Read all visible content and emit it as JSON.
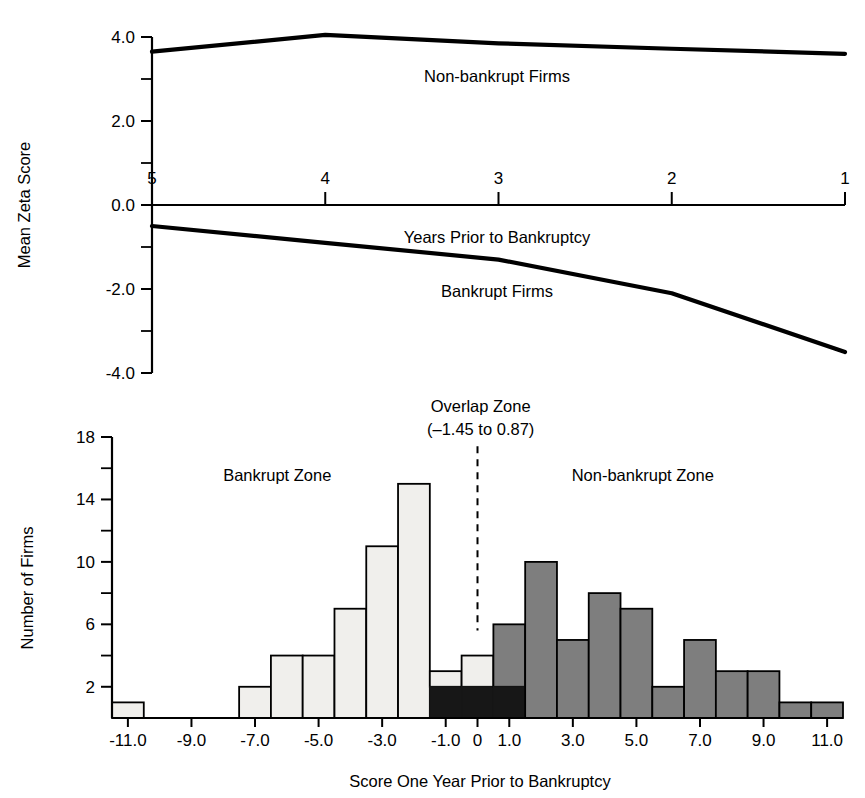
{
  "figure": {
    "background": "#ffffff",
    "line_color": "#000000"
  },
  "chart_data": [
    {
      "type": "line",
      "id": "mean-zeta-score-by-year",
      "title": "",
      "xlabel": "Years Prior to Bankruptcy",
      "ylabel": "Mean Zeta Score",
      "x": [
        5,
        4,
        3,
        2,
        1
      ],
      "xtick_labels": [
        "5",
        "4",
        "3",
        "2",
        "1"
      ],
      "xlim": [
        5,
        1
      ],
      "ylim": [
        -4.0,
        4.0
      ],
      "ytick_labels": [
        "4.0",
        "2.0",
        "0.0",
        "-2.0",
        "-4.0"
      ],
      "ytick_values": [
        4.0,
        2.0,
        0.0,
        -2.0,
        -4.0
      ],
      "yminor_values": [
        3.0,
        1.0,
        -1.0,
        -3.0
      ],
      "grid": false,
      "legend": "inline-labels",
      "series": [
        {
          "name": "Non-bankrupt Firms",
          "label": "Non-bankrupt Firms",
          "values": [
            3.65,
            4.05,
            3.85,
            3.72,
            3.6
          ],
          "color": "#000000"
        },
        {
          "name": "Bankrupt Firms",
          "label": "Bankrupt Firms",
          "values": [
            -0.5,
            -0.9,
            -1.3,
            -2.1,
            -3.5
          ],
          "color": "#000000"
        }
      ]
    },
    {
      "type": "bar",
      "id": "score-distribution-histogram",
      "title": "",
      "xlabel": "Score One Year Prior to Bankruptcy",
      "ylabel": "Number of Firms",
      "xlim": [
        -11.0,
        11.0
      ],
      "ylim": [
        0,
        18
      ],
      "bin_width": 1.0,
      "xtick_labels": [
        "-11.0",
        "-9.0",
        "-7.0",
        "-5.0",
        "-3.0",
        "-1.0",
        "0",
        "1.0",
        "3.0",
        "5.0",
        "7.0",
        "9.0",
        "11.0"
      ],
      "xtick_values": [
        -11,
        -9,
        -7,
        -5,
        -3,
        -1,
        0,
        1,
        3,
        5,
        7,
        9,
        11
      ],
      "ytick_labels": [
        "18",
        "14",
        "10",
        "6",
        "2"
      ],
      "ytick_values": [
        18,
        14,
        10,
        6,
        2
      ],
      "yminor_values": [
        16,
        12,
        8,
        4
      ],
      "grid": false,
      "colors": {
        "bankrupt": "#f0efec",
        "overlap": "#171717",
        "nonbankrupt": "#7e7e7e"
      },
      "bins": [
        {
          "x0": -11.5,
          "x1": -10.5,
          "bankrupt": 1,
          "nonbankrupt": 0
        },
        {
          "x0": -10.5,
          "x1": -9.5,
          "bankrupt": 0,
          "nonbankrupt": 0
        },
        {
          "x0": -9.5,
          "x1": -8.5,
          "bankrupt": 0,
          "nonbankrupt": 0
        },
        {
          "x0": -8.5,
          "x1": -7.5,
          "bankrupt": 0,
          "nonbankrupt": 0
        },
        {
          "x0": -7.5,
          "x1": -6.5,
          "bankrupt": 2,
          "nonbankrupt": 0
        },
        {
          "x0": -6.5,
          "x1": -5.5,
          "bankrupt": 4,
          "nonbankrupt": 0
        },
        {
          "x0": -5.5,
          "x1": -4.5,
          "bankrupt": 4,
          "nonbankrupt": 0
        },
        {
          "x0": -4.5,
          "x1": -3.5,
          "bankrupt": 7,
          "nonbankrupt": 0
        },
        {
          "x0": -3.5,
          "x1": -2.5,
          "bankrupt": 11,
          "nonbankrupt": 0
        },
        {
          "x0": -2.5,
          "x1": -1.5,
          "bankrupt": 15,
          "nonbankrupt": 0
        },
        {
          "x0": -1.5,
          "x1": -0.5,
          "bankrupt": 3,
          "nonbankrupt": 2
        },
        {
          "x0": -0.5,
          "x1": 0.5,
          "bankrupt": 4,
          "nonbankrupt": 2
        },
        {
          "x0": 0.5,
          "x1": 1.5,
          "bankrupt": 2,
          "nonbankrupt": 6
        },
        {
          "x0": 1.5,
          "x1": 2.5,
          "bankrupt": 0,
          "nonbankrupt": 10
        },
        {
          "x0": 2.5,
          "x1": 3.5,
          "bankrupt": 0,
          "nonbankrupt": 5
        },
        {
          "x0": 3.5,
          "x1": 4.5,
          "bankrupt": 0,
          "nonbankrupt": 8
        },
        {
          "x0": 4.5,
          "x1": 5.5,
          "bankrupt": 0,
          "nonbankrupt": 7
        },
        {
          "x0": 5.5,
          "x1": 6.5,
          "bankrupt": 0,
          "nonbankrupt": 2
        },
        {
          "x0": 6.5,
          "x1": 7.5,
          "bankrupt": 0,
          "nonbankrupt": 5
        },
        {
          "x0": 7.5,
          "x1": 8.5,
          "bankrupt": 0,
          "nonbankrupt": 3
        },
        {
          "x0": 8.5,
          "x1": 9.5,
          "bankrupt": 0,
          "nonbankrupt": 3
        },
        {
          "x0": 9.5,
          "x1": 10.5,
          "bankrupt": 0,
          "nonbankrupt": 1
        },
        {
          "x0": 10.5,
          "x1": 11.5,
          "bankrupt": 0,
          "nonbankrupt": 1
        }
      ],
      "annotations": [
        {
          "id": "bankrupt-zone",
          "text": "Bankrupt Zone",
          "x": -6.3,
          "y": 15.2
        },
        {
          "id": "nonbankrupt-zone",
          "text": "Non-bankrupt Zone",
          "x": 5.2,
          "y": 15.2
        },
        {
          "id": "overlap-zone-title",
          "text": "Overlap Zone",
          "x": 0.1,
          "y": 19.6
        },
        {
          "id": "overlap-zone-range",
          "text": "(–1.45 to 0.87)",
          "x": 0.1,
          "y": 18.1
        }
      ],
      "divider": {
        "x": 0.0,
        "y_top": 17.4,
        "y_bottom": 5.6
      }
    }
  ]
}
